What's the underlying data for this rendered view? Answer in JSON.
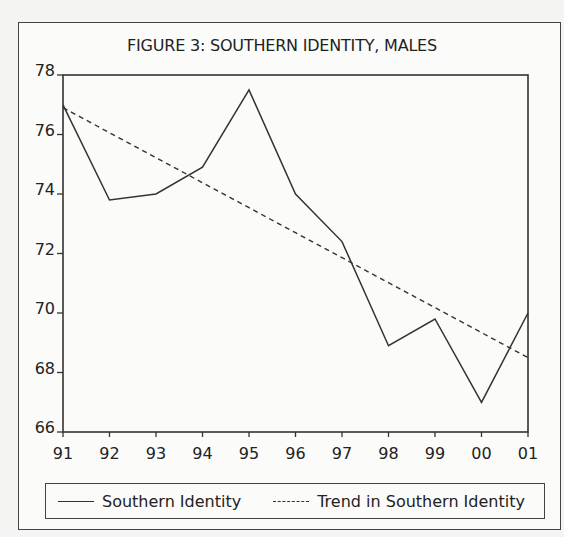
{
  "chart_data": {
    "type": "line",
    "title": "FIGURE 3: SOUTHERN IDENTITY, MALES",
    "xlabel": "",
    "ylabel": "",
    "categories": [
      "91",
      "92",
      "93",
      "94",
      "95",
      "96",
      "97",
      "98",
      "99",
      "00",
      "01"
    ],
    "series": [
      {
        "name": "Southern Identity",
        "style": "solid",
        "values": [
          77.0,
          73.8,
          74.0,
          74.9,
          77.5,
          74.0,
          72.4,
          68.9,
          69.8,
          67.0,
          70.0
        ]
      },
      {
        "name": "Trend in Southern Identity",
        "style": "dashed",
        "values": [
          76.9,
          76.06,
          75.22,
          74.38,
          73.54,
          72.7,
          71.86,
          71.02,
          70.18,
          69.34,
          68.5
        ]
      }
    ],
    "ylim": [
      66,
      78
    ],
    "yticks": [
      "66",
      "68",
      "70",
      "72",
      "74",
      "76",
      "78"
    ],
    "grid": false,
    "legend_position": "bottom"
  },
  "legend": {
    "items": [
      {
        "label": "Southern Identity"
      },
      {
        "label": "Trend in Southern Identity"
      }
    ]
  }
}
